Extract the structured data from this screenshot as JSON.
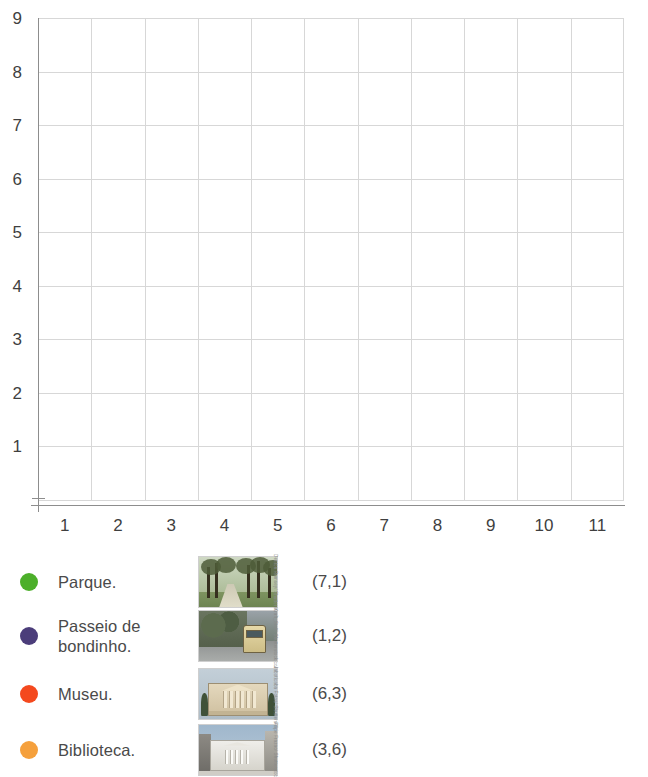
{
  "chart_data": {
    "type": "scatter",
    "title": "",
    "xlabel": "",
    "ylabel": "",
    "xlim": [
      0,
      11
    ],
    "ylim": [
      0,
      9
    ],
    "xticks": [
      "1",
      "2",
      "3",
      "4",
      "5",
      "6",
      "7",
      "8",
      "9",
      "10",
      "11"
    ],
    "yticks": [
      "1",
      "2",
      "3",
      "4",
      "5",
      "6",
      "7",
      "8",
      "9"
    ],
    "grid": true,
    "legend_position": "below",
    "points": [
      {
        "label": "Parque.",
        "x": 7,
        "y": 1,
        "coord_text": "(7,1)",
        "color": "#4caf2a"
      },
      {
        "label": "Passeio de bondinho.",
        "x": 1,
        "y": 2,
        "coord_text": "(1,2)",
        "color": "#4b3d7a"
      },
      {
        "label": "Museu.",
        "x": 6,
        "y": 3,
        "coord_text": "(6,3)",
        "color": "#f4491e"
      },
      {
        "label": "Biblioteca.",
        "x": 3,
        "y": 6,
        "coord_text": "(3,6)",
        "color": "#f5a03c"
      }
    ],
    "series": [
      {
        "name": "Parque.",
        "values": [
          [
            7,
            1
          ]
        ]
      },
      {
        "name": "Passeio de bondinho.",
        "values": [
          [
            1,
            2
          ]
        ]
      },
      {
        "name": "Museu.",
        "values": [
          [
            6,
            3
          ]
        ]
      },
      {
        "name": "Biblioteca.",
        "values": [
          [
            3,
            6
          ]
        ]
      }
    ]
  },
  "legend": {
    "rows": [
      {
        "label": "Parque.",
        "coord": "(7,1)",
        "color": "#4caf2a",
        "dot_name": "legend-dot-parque",
        "thumb_name": "thumbnail-parque",
        "thumb_alt": "park-with-trees-photo",
        "credit": "Denton Rumsey/ Shutterstock.com"
      },
      {
        "label": "Passeio de bondinho.",
        "coord": "(1,2)",
        "color": "#4b3d7a",
        "dot_name": "legend-dot-passeio-de-bondinho",
        "thumb_name": "thumbnail-passeio-de-bondinho",
        "thumb_alt": "tram-on-tree-lined-street-photo",
        "credit": "Kraft_Stoff/ Shutterstock.com"
      },
      {
        "label": "Museu.",
        "coord": "(6,3)",
        "color": "#f4491e",
        "dot_name": "legend-dot-museu",
        "thumb_name": "thumbnail-museu",
        "thumb_alt": "neoclassical-museum-building-photo",
        "credit": "Jaboticaba Fotos/ Shutterstock.com"
      },
      {
        "label": "Biblioteca.",
        "coord": "(3,6)",
        "color": "#f5a03c",
        "dot_name": "legend-dot-biblioteca",
        "thumb_name": "thumbnail-biblioteca",
        "thumb_alt": "library-building-facade-photo",
        "credit": "Filipe Frazao/ Shutterstock.com"
      }
    ]
  },
  "colors": {
    "axis": "#8d8d8d",
    "grid": "#d7d7d7",
    "tick_text": "#3f3f3f",
    "legend_text": "#4a4a4a",
    "background": "#ffffff"
  }
}
